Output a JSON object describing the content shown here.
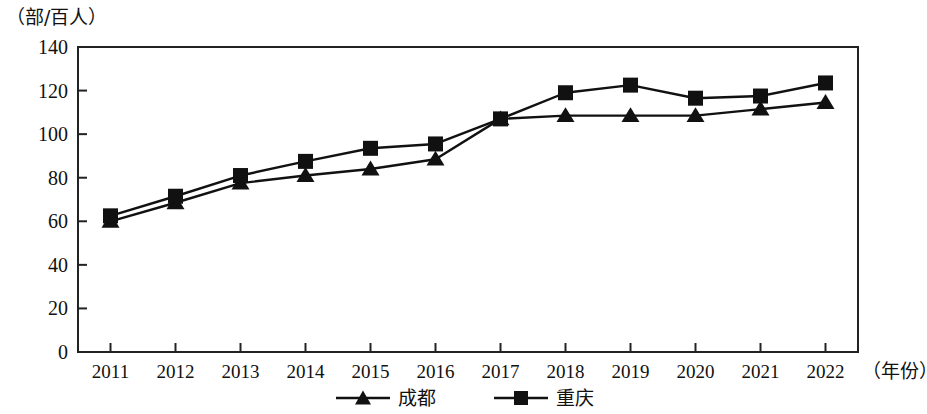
{
  "chart_data": {
    "type": "line",
    "title": "",
    "subtitle": "",
    "xlabel": "（年份）",
    "ylabel": "（部/百人）",
    "categories": [
      "2011",
      "2012",
      "2013",
      "2014",
      "2015",
      "2016",
      "2017",
      "2018",
      "2019",
      "2020",
      "2021",
      "2022"
    ],
    "x": [
      2011,
      2012,
      2013,
      2014,
      2015,
      2016,
      2017,
      2018,
      2019,
      2020,
      2021,
      2022
    ],
    "series": [
      {
        "name": "成都",
        "marker": "triangle",
        "color": "#111111",
        "values": [
          60,
          68.5,
          77.5,
          81,
          84,
          88.5,
          107,
          108.5,
          108.5,
          108.5,
          111.5,
          114.5
        ]
      },
      {
        "name": "重庆",
        "marker": "square",
        "color": "#111111",
        "values": [
          62.5,
          71.5,
          81,
          87.5,
          93.5,
          95.5,
          107,
          119,
          122.5,
          116.5,
          117.5,
          123.5
        ]
      }
    ],
    "ylim": [
      0,
      140
    ],
    "yticks": [
      0,
      20,
      40,
      60,
      80,
      100,
      120,
      140
    ],
    "ytick_labels": [
      "0",
      "20",
      "40",
      "60",
      "80",
      "100",
      "120",
      "140"
    ],
    "grid": false,
    "legend_position": "bottom",
    "legend_entries": [
      "成都",
      "重庆"
    ]
  }
}
